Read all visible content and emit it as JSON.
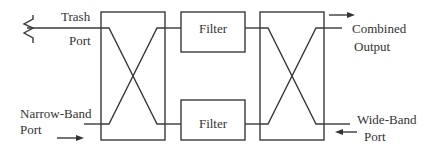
{
  "diagram": {
    "type": "block-diagram",
    "colors": {
      "line": "#3a3a3a",
      "text": "#333333",
      "background": "#ffffff"
    },
    "blocks": {
      "left_coupler": {
        "label": ""
      },
      "filter_top": {
        "label": "Filter"
      },
      "filter_bottom": {
        "label": "Filter"
      },
      "right_coupler": {
        "label": ""
      }
    },
    "ports": {
      "trash": {
        "line1": "Trash",
        "line2": "Port",
        "termination": "resistor-load-icon"
      },
      "narrow_band": {
        "line1": "Narrow-Band",
        "line2": "Port",
        "arrow": "right-arrow-icon"
      },
      "combined_output": {
        "line1": "Combined",
        "line2": "Output",
        "arrow": "right-arrow-icon"
      },
      "wide_band": {
        "line1": "Wide-Band",
        "line2": "Port",
        "arrow": "left-arrow-icon"
      }
    }
  }
}
